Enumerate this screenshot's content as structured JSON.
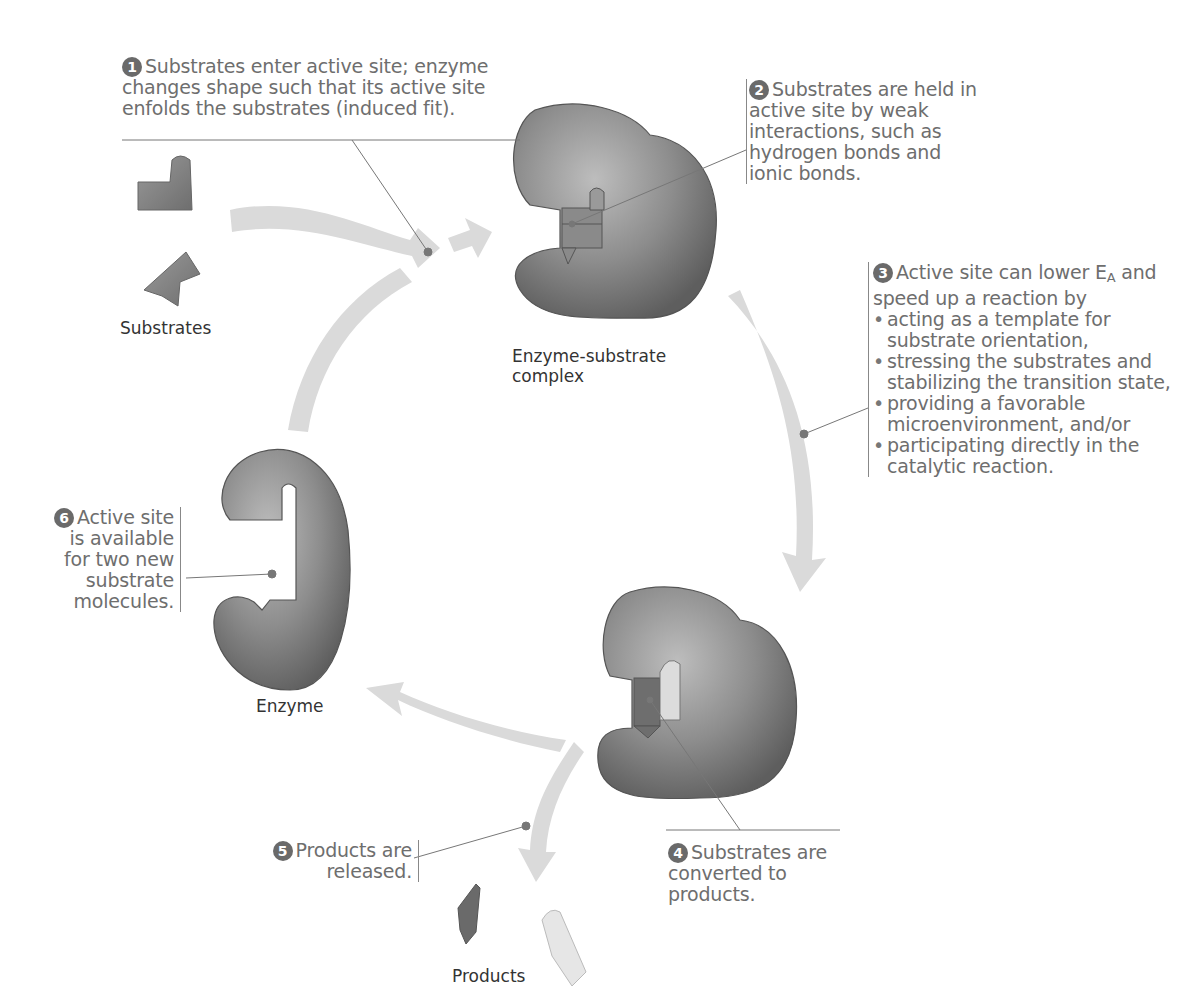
{
  "colors": {
    "enzyme": "#7a7a7a",
    "enzyme_highlight": "#b8b8b8",
    "arrow": "#d9d9d9",
    "callout_text": "#6e6e6e",
    "label_text": "#333333",
    "badge": "#6a6a6a"
  },
  "labels": {
    "substrates": "Substrates",
    "complex_line1": "Enzyme-substrate",
    "complex_line2": "complex",
    "enzyme": "Enzyme",
    "products": "Products"
  },
  "steps": [
    {
      "number": "1",
      "text": "Substrates enter active site; enzyme changes shape such that its active site enfolds the substrates (induced fit)."
    },
    {
      "number": "2",
      "text": "Substrates are held in active site by weak interactions, such as hydrogen bonds and ionic bonds."
    },
    {
      "number": "3",
      "intro": "Active site can lower E",
      "intro_sub": "A",
      "intro_end": " and speed up a reaction by",
      "bullets": [
        "acting as a template for substrate orientation,",
        "stressing the substrates and stabilizing the transition state,",
        "providing a favorable microenvironment, and/or",
        "participating directly in the catalytic reaction."
      ]
    },
    {
      "number": "4",
      "text": "Substrates are converted to products."
    },
    {
      "number": "5",
      "text": "Products are released."
    },
    {
      "number": "6",
      "text": "Active site is available for two new substrate molecules."
    }
  ]
}
